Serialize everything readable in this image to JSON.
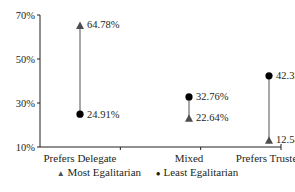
{
  "chart_data": {
    "type": "dumbbell",
    "title": "",
    "xlabel": "",
    "ylabel": "",
    "ylim": [
      10,
      70
    ],
    "yticks": [
      "70%",
      "50%",
      "30%",
      "10%"
    ],
    "categories": [
      "Prefers Delegate",
      "Mixed",
      "Prefers Trustee"
    ],
    "series": [
      {
        "name": "Most Egalitarian",
        "marker": "triangle",
        "values": [
          64.78,
          22.64,
          12.58
        ],
        "labels": [
          "64.78%",
          "22.64%",
          "12.58%"
        ]
      },
      {
        "name": "Least Egalitarian",
        "marker": "circle",
        "values": [
          24.91,
          32.76,
          42.33
        ],
        "labels": [
          "24.91%",
          "32.76%",
          "42.33%"
        ]
      }
    ],
    "grid": false,
    "legend_position": "bottom"
  },
  "legend": {
    "most": "Most Egalitarian",
    "least": "Least Egalitarian"
  },
  "colors": {
    "ink": "#231f20",
    "marker_most": "#4d4d4f",
    "marker_least": "#000000"
  }
}
